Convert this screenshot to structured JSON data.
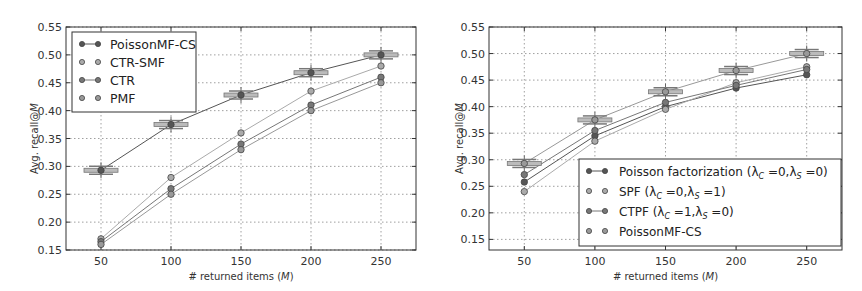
{
  "chart_data": [
    {
      "type": "line",
      "title": "",
      "xlabel": "# returned items (M)",
      "ylabel": "Avg. recall@M",
      "x": [
        50,
        100,
        150,
        200,
        250
      ],
      "xticks": [
        "50",
        "100",
        "150",
        "200",
        "250"
      ],
      "yticks": [
        "0.15",
        "0.20",
        "0.25",
        "0.30",
        "0.35",
        "0.40",
        "0.45",
        "0.50",
        "0.55"
      ],
      "xlim": [
        25,
        275
      ],
      "ylim": [
        0.15,
        0.55
      ],
      "grid": true,
      "legend_position": "upper left",
      "series": [
        {
          "name": "PoissonMF-CS",
          "values": [
            0.293,
            0.375,
            0.428,
            0.468,
            0.5
          ],
          "color": "#555555",
          "boxplot": true
        },
        {
          "name": "CTR-SMF",
          "values": [
            0.17,
            0.28,
            0.36,
            0.435,
            0.48
          ],
          "color": "#aaaaaa"
        },
        {
          "name": "CTR",
          "values": [
            0.165,
            0.26,
            0.34,
            0.41,
            0.46
          ],
          "color": "#777777"
        },
        {
          "name": "PMF",
          "values": [
            0.16,
            0.25,
            0.33,
            0.4,
            0.45
          ],
          "color": "#999999"
        }
      ]
    },
    {
      "type": "line",
      "title": "",
      "xlabel": "# returned items (M)",
      "ylabel": "Avg. recall@M",
      "x": [
        50,
        100,
        150,
        200,
        250
      ],
      "xticks": [
        "50",
        "100",
        "150",
        "200",
        "250"
      ],
      "yticks": [
        "0.15",
        "0.20",
        "0.25",
        "0.30",
        "0.35",
        "0.40",
        "0.45",
        "0.50",
        "0.55"
      ],
      "xlim": [
        25,
        275
      ],
      "ylim": [
        0.13,
        0.55
      ],
      "grid": true,
      "legend_position": "lower right",
      "series": [
        {
          "name": "Poisson factorization (λC =0,λS =0)",
          "values": [
            0.258,
            0.345,
            0.4,
            0.435,
            0.46
          ],
          "color": "#555555"
        },
        {
          "name": "SPF (λC =0,λS =1)",
          "values": [
            0.24,
            0.335,
            0.395,
            0.445,
            0.475
          ],
          "color": "#aaaaaa"
        },
        {
          "name": "CTPF (λC =1,λS =0)",
          "values": [
            0.272,
            0.355,
            0.408,
            0.44,
            0.47
          ],
          "color": "#777777"
        },
        {
          "name": "PoissonMF-CS",
          "values": [
            0.293,
            0.375,
            0.428,
            0.468,
            0.5
          ],
          "color": "#999999",
          "boxplot": true
        }
      ]
    }
  ],
  "left": {
    "ylabel": "Avg. recall@M",
    "xlabel": "# returned items (M)",
    "legend": [
      "PoissonMF-CS",
      "CTR-SMF",
      "CTR",
      "PMF"
    ]
  },
  "right": {
    "ylabel": "Avg. recall@M",
    "xlabel": "# returned items (M)",
    "legend": [
      "Poisson factorization (",
      "SPF (",
      "CTPF (",
      "PoissonMF-CS"
    ]
  }
}
